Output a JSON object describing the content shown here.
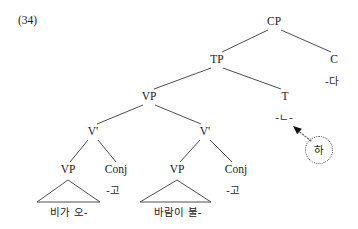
{
  "figure": {
    "example_number": "(34)",
    "type": "syntax-tree-diagram",
    "language": "Korean"
  },
  "tree": {
    "nodes": [
      {
        "id": "CP",
        "label": "CP",
        "x": 274,
        "y": 22
      },
      {
        "id": "TP",
        "label": "TP",
        "x": 217,
        "y": 60
      },
      {
        "id": "C",
        "label": "C",
        "x": 334,
        "y": 60
      },
      {
        "id": "C_morph",
        "label": "-다",
        "x": 332,
        "y": 81
      },
      {
        "id": "VP_top",
        "label": "VP",
        "x": 149,
        "y": 97
      },
      {
        "id": "T",
        "label": "T",
        "x": 285,
        "y": 97
      },
      {
        "id": "T_morph",
        "label": "-ㄴ-",
        "x": 284,
        "y": 117
      },
      {
        "id": "Vbar_L",
        "label": "V'",
        "x": 93,
        "y": 132
      },
      {
        "id": "Vbar_R",
        "label": "V'",
        "x": 205,
        "y": 132
      },
      {
        "id": "VP_L",
        "label": "VP",
        "x": 68,
        "y": 170
      },
      {
        "id": "Conj_L",
        "label": "Conj",
        "x": 116,
        "y": 170
      },
      {
        "id": "Conj_L_m",
        "label": "-고",
        "x": 113,
        "y": 190
      },
      {
        "id": "VP_R",
        "label": "VP",
        "x": 177,
        "y": 170
      },
      {
        "id": "Conj_R",
        "label": "Conj",
        "x": 236,
        "y": 170
      },
      {
        "id": "Conj_R_m",
        "label": "-고",
        "x": 233,
        "y": 190
      }
    ],
    "terminals": [
      {
        "id": "term_L",
        "label": "비가 오-",
        "x": 69,
        "y": 212
      },
      {
        "id": "term_R",
        "label": "바람이 불-",
        "x": 178,
        "y": 212
      }
    ],
    "branches": [
      {
        "from": "CP",
        "to": "TP",
        "x1": 268,
        "y1": 30,
        "x2": 222,
        "y2": 52
      },
      {
        "from": "CP",
        "to": "C",
        "x1": 281,
        "y1": 30,
        "x2": 331,
        "y2": 52
      },
      {
        "from": "TP",
        "to": "VP_top",
        "x1": 211,
        "y1": 68,
        "x2": 154,
        "y2": 89
      },
      {
        "from": "TP",
        "to": "T",
        "x1": 223,
        "y1": 68,
        "x2": 281,
        "y2": 89
      },
      {
        "from": "VP_top",
        "to": "Vbar_L",
        "x1": 143,
        "y1": 105,
        "x2": 97,
        "y2": 124
      },
      {
        "from": "VP_top",
        "to": "Vbar_R",
        "x1": 155,
        "y1": 105,
        "x2": 201,
        "y2": 124
      },
      {
        "from": "Vbar_L",
        "to": "VP_L",
        "x1": 88,
        "y1": 140,
        "x2": 70,
        "y2": 162
      },
      {
        "from": "Vbar_L",
        "to": "Conj_L",
        "x1": 98,
        "y1": 140,
        "x2": 116,
        "y2": 162
      },
      {
        "from": "Vbar_R",
        "to": "VP_R",
        "x1": 200,
        "y1": 140,
        "x2": 180,
        "y2": 162
      },
      {
        "from": "Vbar_R",
        "to": "Conj_R",
        "x1": 210,
        "y1": 140,
        "x2": 232,
        "y2": 162
      }
    ],
    "triangles": [
      {
        "under": "VP_L",
        "apex_x": 68,
        "apex_y": 180,
        "left_x": 37,
        "right_x": 100,
        "base_y": 202
      },
      {
        "under": "VP_R",
        "apex_x": 177,
        "apex_y": 180,
        "left_x": 140,
        "right_x": 211,
        "base_y": 202
      }
    ]
  },
  "movement": {
    "moved_element": {
      "label": "하",
      "x": 319,
      "y": 150
    },
    "arrow": {
      "start_x": 311,
      "start_y": 141,
      "end_x": 293,
      "end_y": 126,
      "style": "dotted",
      "head": "filled-triangle"
    },
    "circle_style": "dotted"
  },
  "colors": {
    "background": "#ffffff",
    "ink": "#1a1a1a",
    "line": "#3a3a3a",
    "dotted": "#555555"
  }
}
